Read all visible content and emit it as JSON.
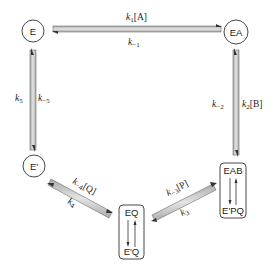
{
  "diagram": {
    "type": "enzyme kinetic mechanism (cyclic)",
    "nodes": [
      {
        "id": "E",
        "label": "E",
        "shape": "circle"
      },
      {
        "id": "EA",
        "label": "EA",
        "shape": "circle"
      },
      {
        "id": "EAB_EPQ",
        "label_top": "EAB",
        "label_bottom": "E'PQ",
        "shape": "rounded-box"
      },
      {
        "id": "EQ_EQ",
        "label_top": "EQ",
        "label_bottom": "E'Q",
        "shape": "rounded-box"
      },
      {
        "id": "E_prime",
        "label": "E'",
        "shape": "circle"
      }
    ],
    "edges": [
      {
        "from": "E",
        "to": "EA",
        "forward": "k1[A]",
        "reverse": "k-1"
      },
      {
        "from": "EA",
        "to": "EAB_EPQ",
        "forward": "k2[B]",
        "reverse": "k-2"
      },
      {
        "from": "EAB_EPQ",
        "to": "EQ_EQ",
        "forward": "k3",
        "reverse": "k-3[P]"
      },
      {
        "from": "EQ_EQ",
        "to": "E_prime",
        "forward": "k4",
        "reverse": "k-4[Q]"
      },
      {
        "from": "E_prime",
        "to": "E",
        "forward": "k5",
        "reverse": "k-5"
      }
    ],
    "labels": {
      "k1": {
        "k": "k",
        "sub": "1",
        "tail": "[A]"
      },
      "km1": {
        "k": "k",
        "sub": "−1",
        "tail": ""
      },
      "k2": {
        "k": "k",
        "sub": "2",
        "tail": "[B]"
      },
      "km2": {
        "k": "k",
        "sub": "−2",
        "tail": ""
      },
      "k3": {
        "k": "k",
        "sub": "3",
        "tail": ""
      },
      "km3": {
        "k": "k",
        "sub": "−3",
        "tail": "[P]"
      },
      "k4": {
        "k": "k",
        "sub": "4",
        "tail": ""
      },
      "km4": {
        "k": "k",
        "sub": "−4",
        "tail": "[Q]"
      },
      "k5": {
        "k": "k",
        "sub": "5",
        "tail": ""
      },
      "km5": {
        "k": "k",
        "sub": "−5",
        "tail": ""
      }
    },
    "colors": {
      "arrow_fill": "#c8c8c8",
      "stroke": "#333333"
    }
  }
}
